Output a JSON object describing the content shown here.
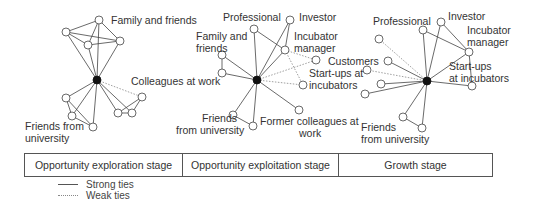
{
  "colors": {
    "strong_tie": "#444444",
    "weak_tie": "#888888",
    "ego_node": "#111111",
    "alter_node": "#ffffff"
  },
  "networks": [
    {
      "stage": "Opportunity exploration stage",
      "labels": {
        "family_friends": "Family and friends",
        "colleagues": "Colleagues at work",
        "friends_uni_1": "Friends from",
        "friends_uni_2": "university"
      }
    },
    {
      "stage": "Opportunity exploitation stage",
      "labels": {
        "professional": "Professional",
        "investor": "Investor",
        "family_1": "Family and",
        "family_2": "friends",
        "incubator_1": "Incubator",
        "incubator_2": "manager",
        "startups_1": "Start-ups at",
        "startups_2": "incubators",
        "colleagues_tail": "gues at work",
        "friends_uni_1": "Friends",
        "friends_uni_2": "from university",
        "former_1": "Former colleagues at",
        "former_2": "work"
      }
    },
    {
      "stage": "Growth stage",
      "labels": {
        "professional": "Professional",
        "investor": "Investor",
        "incubator_1": "Incubator",
        "incubator_2": "manager",
        "customers": "Customers",
        "startups_1": "Start-ups",
        "startups_2": "at incubators",
        "friends_uni_1": "Friends",
        "friends_uni_2": "from university"
      }
    }
  ],
  "legend": {
    "strong": "Strong ties",
    "weak": "Weak ties"
  }
}
